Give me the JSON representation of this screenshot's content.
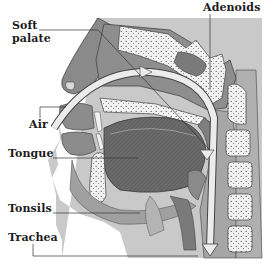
{
  "diagram": {
    "type": "anatomical-cross-section",
    "colors": {
      "background_panel": "#c9c9c9",
      "tissue_dark": "#6e6e6e",
      "tissue_mid": "#9a9a9a",
      "bone": "#eeeeee",
      "airflow_arrow": "#e6e6e6",
      "label_text": "#1c1c1c",
      "leader_line": "#333333"
    },
    "labels": {
      "soft_palate_line1": "Soft",
      "soft_palate_line2": "palate",
      "adenoids": "Adenoids",
      "air": "Air",
      "tongue": "Tongue",
      "tonsils": "Tonsils",
      "trachea": "Trachea"
    }
  }
}
